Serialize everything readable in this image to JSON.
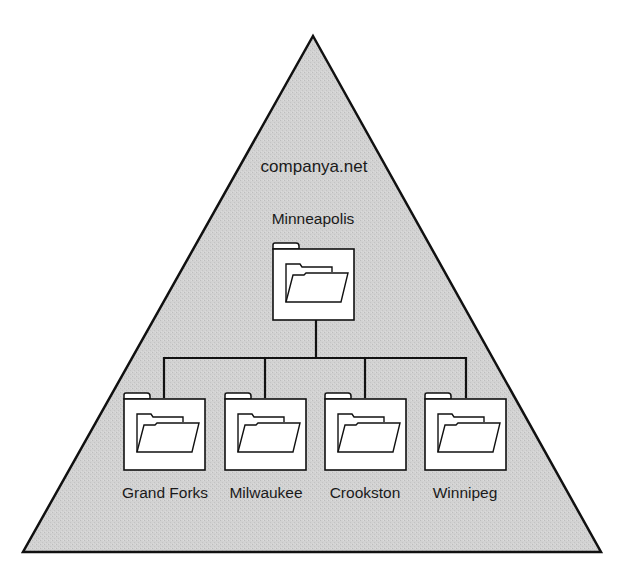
{
  "diagram": {
    "type": "active-directory-domain-tree",
    "domain": {
      "name": "companya.net",
      "shape": "triangle",
      "fill_color": "#d2d2d2",
      "stroke_color": "#111111"
    },
    "root_ou": {
      "label": "Minneapolis",
      "icon": "folder-icon"
    },
    "child_ous": [
      {
        "label": "Grand Forks",
        "icon": "folder-icon"
      },
      {
        "label": "Milwaukee",
        "icon": "folder-icon"
      },
      {
        "label": "Crookston",
        "icon": "folder-icon"
      },
      {
        "label": "Winnipeg",
        "icon": "folder-icon"
      }
    ]
  }
}
